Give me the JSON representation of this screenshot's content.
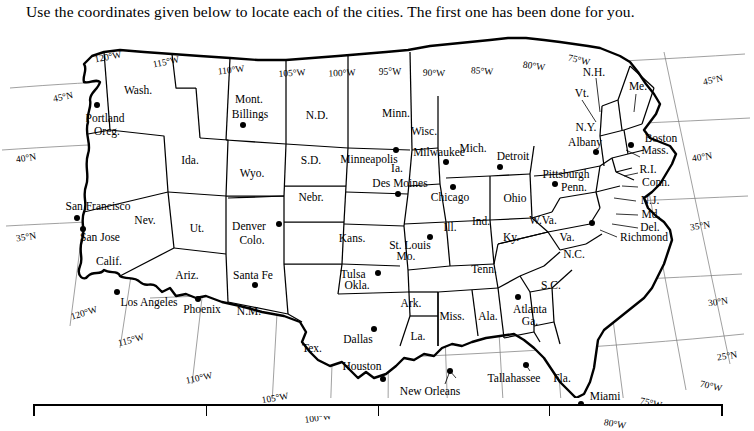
{
  "instruction": "Use the coordinates given below to locate each of the cities. The first one has been done for you.",
  "map": {
    "title": "United States political map with latitude and longitude grid",
    "latitude_labels_left": [
      "45°N",
      "40°N",
      "35°N"
    ],
    "latitude_labels_right": [
      "45°N",
      "40°N",
      "35°N",
      "30°N",
      "25°N"
    ],
    "longitude_labels_top": [
      "120°W",
      "115°W",
      "110°W",
      "105°W",
      "100°W",
      "95°W",
      "90°W",
      "85°W",
      "80°W",
      "75°W"
    ],
    "longitude_labels_bottom": [
      "120°W",
      "115°W",
      "110°W",
      "105°W",
      "100°W",
      "75°W",
      "70°W",
      "80°W"
    ],
    "grid_labels": [
      {
        "text": "120°W",
        "x": 108,
        "y": 31,
        "rot": -11
      },
      {
        "text": "115°W",
        "x": 166,
        "y": 36,
        "rot": -11
      },
      {
        "text": "110°W",
        "x": 231,
        "y": 44,
        "rot": -7
      },
      {
        "text": "105°W",
        "x": 292,
        "y": 47,
        "rot": -4
      },
      {
        "text": "100°W",
        "x": 342,
        "y": 47,
        "rot": -2
      },
      {
        "text": "95°W",
        "x": 390,
        "y": 46,
        "rot": 0
      },
      {
        "text": "90°W",
        "x": 434,
        "y": 47,
        "rot": 2
      },
      {
        "text": "85°W",
        "x": 482,
        "y": 45,
        "rot": 4
      },
      {
        "text": "80°W",
        "x": 534,
        "y": 40,
        "rot": 8
      },
      {
        "text": "75°W",
        "x": 579,
        "y": 34,
        "rot": 12
      },
      {
        "text": "45°N",
        "x": 63,
        "y": 71,
        "rot": -12
      },
      {
        "text": "40°N",
        "x": 26,
        "y": 132,
        "rot": -9
      },
      {
        "text": "35°N",
        "x": 26,
        "y": 211,
        "rot": -9
      },
      {
        "text": "45°N",
        "x": 713,
        "y": 54,
        "rot": -13
      },
      {
        "text": "40°N",
        "x": 702,
        "y": 131,
        "rot": -9
      },
      {
        "text": "35°N",
        "x": 700,
        "y": 200,
        "rot": -9
      },
      {
        "text": "30°N",
        "x": 718,
        "y": 276,
        "rot": -8
      },
      {
        "text": "25°N",
        "x": 727,
        "y": 330,
        "rot": -9
      },
      {
        "text": "120°W",
        "x": 84,
        "y": 287,
        "rot": -17
      },
      {
        "text": "115°W",
        "x": 131,
        "y": 314,
        "rot": -15
      },
      {
        "text": "110°W",
        "x": 199,
        "y": 352,
        "rot": -12
      },
      {
        "text": "105°W",
        "x": 275,
        "y": 372,
        "rot": -10
      },
      {
        "text": "100°W",
        "x": 318,
        "y": 392,
        "rot": -8
      },
      {
        "text": "75°W",
        "x": 651,
        "y": 377,
        "rot": 12
      },
      {
        "text": "70°W",
        "x": 711,
        "y": 360,
        "rot": 13
      },
      {
        "text": "80°W",
        "x": 615,
        "y": 398,
        "rot": 10
      }
    ],
    "state_labels": [
      {
        "text": "Wash.",
        "x": 138,
        "y": 64
      },
      {
        "text": "Oreg.",
        "x": 107,
        "y": 105
      },
      {
        "text": "Ida.",
        "x": 190,
        "y": 134
      },
      {
        "text": "Mont.",
        "x": 249,
        "y": 73
      },
      {
        "text": "Wyo.",
        "x": 252,
        "y": 147
      },
      {
        "text": "N.D.",
        "x": 317,
        "y": 89
      },
      {
        "text": "S.D.",
        "x": 311,
        "y": 134
      },
      {
        "text": "Nebr.",
        "x": 311,
        "y": 171
      },
      {
        "text": "Nev.",
        "x": 145,
        "y": 194
      },
      {
        "text": "Ut.",
        "x": 197,
        "y": 202
      },
      {
        "text": "Calif.",
        "x": 109,
        "y": 235
      },
      {
        "text": "Ariz.",
        "x": 187,
        "y": 249
      },
      {
        "text": "Colo.",
        "x": 252,
        "y": 214
      },
      {
        "text": "N.M.",
        "x": 249,
        "y": 285
      },
      {
        "text": "Kans.",
        "x": 352,
        "y": 212
      },
      {
        "text": "Okla.",
        "x": 357,
        "y": 259
      },
      {
        "text": "Tex.",
        "x": 312,
        "y": 322
      },
      {
        "text": "Minn.",
        "x": 396,
        "y": 87
      },
      {
        "text": "Ia.",
        "x": 397,
        "y": 142
      },
      {
        "text": "Mo.",
        "x": 406,
        "y": 230
      },
      {
        "text": "Ark.",
        "x": 411,
        "y": 277
      },
      {
        "text": "La.",
        "x": 418,
        "y": 310
      },
      {
        "text": "Wisc.",
        "x": 424,
        "y": 105
      },
      {
        "text": "Ill.",
        "x": 450,
        "y": 201
      },
      {
        "text": "Miss.",
        "x": 452,
        "y": 290
      },
      {
        "text": "Ala.",
        "x": 488,
        "y": 290
      },
      {
        "text": "Mich.",
        "x": 473,
        "y": 122
      },
      {
        "text": "Ind.",
        "x": 481,
        "y": 195
      },
      {
        "text": "Ky.",
        "x": 511,
        "y": 211
      },
      {
        "text": "Tenn.",
        "x": 484,
        "y": 243
      },
      {
        "text": "Ohio",
        "x": 515,
        "y": 172
      },
      {
        "text": "W.Va.",
        "x": 543,
        "y": 194
      },
      {
        "text": "Va.",
        "x": 567,
        "y": 211
      },
      {
        "text": "N.C.",
        "x": 574,
        "y": 228
      },
      {
        "text": "S.C.",
        "x": 551,
        "y": 259
      },
      {
        "text": "Ga.",
        "x": 530,
        "y": 295
      },
      {
        "text": "Fla.",
        "x": 562,
        "y": 352
      },
      {
        "text": "Penn.",
        "x": 574,
        "y": 161
      },
      {
        "text": "N.Y.",
        "x": 586,
        "y": 101
      },
      {
        "text": "Vt.",
        "x": 582,
        "y": 67
      },
      {
        "text": "N.H.",
        "x": 594,
        "y": 46
      },
      {
        "text": "Me.",
        "x": 638,
        "y": 60
      },
      {
        "text": "Mass.",
        "x": 655,
        "y": 124
      },
      {
        "text": "R.I.",
        "x": 648,
        "y": 143
      },
      {
        "text": "Conn.",
        "x": 656,
        "y": 156
      },
      {
        "text": "N.J.",
        "x": 650,
        "y": 174
      },
      {
        "text": "Md.",
        "x": 651,
        "y": 188
      },
      {
        "text": "Del.",
        "x": 650,
        "y": 201
      }
    ],
    "city_labels": [
      {
        "text": "Portland",
        "x": 105,
        "y": 92
      },
      {
        "text": "San Francisco",
        "x": 98,
        "y": 180
      },
      {
        "text": "San Jose",
        "x": 100,
        "y": 211
      },
      {
        "text": "Los Angeles",
        "x": 149,
        "y": 276
      },
      {
        "text": "Phoenix",
        "x": 202,
        "y": 283
      },
      {
        "text": "Santa Fe",
        "x": 253,
        "y": 249
      },
      {
        "text": "Denver",
        "x": 249,
        "y": 200
      },
      {
        "text": "Billings",
        "x": 250,
        "y": 88
      },
      {
        "text": "Minneapolis",
        "x": 369,
        "y": 133
      },
      {
        "text": "Des Moines",
        "x": 400,
        "y": 157
      },
      {
        "text": "Milwaukee",
        "x": 439,
        "y": 126
      },
      {
        "text": "Chicago",
        "x": 450,
        "y": 171
      },
      {
        "text": "St. Louis",
        "x": 410,
        "y": 219
      },
      {
        "text": "Tulsa",
        "x": 353,
        "y": 248
      },
      {
        "text": "Dallas",
        "x": 358,
        "y": 313
      },
      {
        "text": "Houston",
        "x": 362,
        "y": 340
      },
      {
        "text": "New Orleans",
        "x": 430,
        "y": 365
      },
      {
        "text": "Tallahassee",
        "x": 514,
        "y": 352
      },
      {
        "text": "Miami",
        "x": 605,
        "y": 370
      },
      {
        "text": "Atlanta",
        "x": 530,
        "y": 283
      },
      {
        "text": "Detroit",
        "x": 513,
        "y": 130
      },
      {
        "text": "Pittsburgh",
        "x": 566,
        "y": 148
      },
      {
        "text": "Albany",
        "x": 585,
        "y": 116
      },
      {
        "text": "Boston",
        "x": 661,
        "y": 112
      },
      {
        "text": "Richmond",
        "x": 644,
        "y": 211
      }
    ],
    "city_dots": [
      {
        "name": "portland",
        "x": 97,
        "y": 79
      },
      {
        "name": "san-francisco",
        "x": 77,
        "y": 192
      },
      {
        "name": "san-jose",
        "x": 83,
        "y": 203
      },
      {
        "name": "los-angeles",
        "x": 117,
        "y": 266
      },
      {
        "name": "phoenix",
        "x": 198,
        "y": 273
      },
      {
        "name": "santa-fe",
        "x": 255,
        "y": 259
      },
      {
        "name": "denver",
        "x": 279,
        "y": 198
      },
      {
        "name": "billings",
        "x": 243,
        "y": 99
      },
      {
        "name": "minneapolis",
        "x": 396,
        "y": 124
      },
      {
        "name": "des-moines",
        "x": 398,
        "y": 168
      },
      {
        "name": "milwaukee",
        "x": 446,
        "y": 136
      },
      {
        "name": "chicago",
        "x": 453,
        "y": 161
      },
      {
        "name": "st-louis",
        "x": 430,
        "y": 211
      },
      {
        "name": "tulsa",
        "x": 378,
        "y": 247
      },
      {
        "name": "dallas",
        "x": 374,
        "y": 303
      },
      {
        "name": "houston",
        "x": 383,
        "y": 353
      },
      {
        "name": "new-orleans",
        "x": 450,
        "y": 345
      },
      {
        "name": "tallahassee",
        "x": 526,
        "y": 339
      },
      {
        "name": "miami",
        "x": 581,
        "y": 378
      },
      {
        "name": "atlanta",
        "x": 518,
        "y": 271
      },
      {
        "name": "detroit",
        "x": 500,
        "y": 141
      },
      {
        "name": "pittsburgh",
        "x": 555,
        "y": 158
      },
      {
        "name": "albany",
        "x": 596,
        "y": 126
      },
      {
        "name": "boston",
        "x": 631,
        "y": 119
      },
      {
        "name": "richmond",
        "x": 592,
        "y": 197
      }
    ]
  },
  "answer_table": {
    "columns": 4
  }
}
